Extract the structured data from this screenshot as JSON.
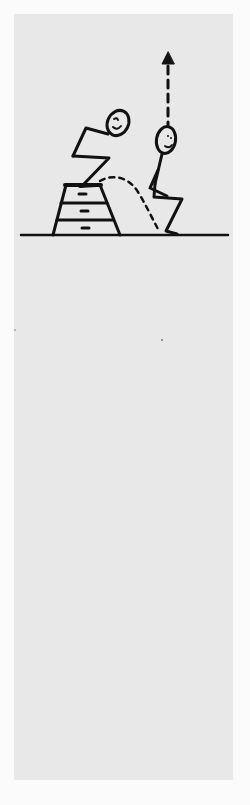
{
  "figure": {
    "subject": "depth jump exercise",
    "elements": [
      "jump-box",
      "athlete-crouched-on-box",
      "dotted-trajectory",
      "athlete-landing-squat",
      "upward-dashed-arrow",
      "ground-line"
    ],
    "colors": {
      "ink": "#111111",
      "panel": "#e8e8e8",
      "background": "#fbfbfb"
    }
  }
}
